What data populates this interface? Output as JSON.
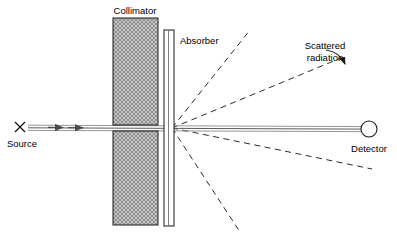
{
  "figure": {
    "title_visible": false,
    "background_color": "#ffffff",
    "width": 397,
    "height": 241,
    "type": "scientific-schematic"
  },
  "labels": {
    "collimator": "Collimator",
    "absorber": "Absorber",
    "scattered_radiation_line1": "Scattered",
    "scattered_radiation_line2": "radiation",
    "source": "Source",
    "detector": "Detector",
    "source_marker": "X"
  },
  "colors": {
    "line": "#1a1a1a",
    "beam": "#5d5d5d",
    "dashed": "#2b2b2b",
    "hatch_fill": "#9a9a9a",
    "background": "#ffffff"
  },
  "components": {
    "collimator": {
      "name": "collimator",
      "description": "two hatched blocks separated by a narrow horizontal slit",
      "upper_block": {
        "x": 113,
        "y": 18,
        "width": 45,
        "height": 107
      },
      "lower_block": {
        "x": 113,
        "y": 131,
        "width": 45,
        "height": 94
      },
      "slit_center_y": 128
    },
    "absorber": {
      "name": "absorber",
      "description": "thin vertical plate",
      "x": 164,
      "y": 30,
      "width": 10,
      "height": 196
    },
    "source": {
      "name": "source",
      "marker": "X",
      "x": 20,
      "y": 127
    },
    "detector": {
      "name": "detector",
      "shape": "circle",
      "cx": 369,
      "cy": 129,
      "r": 8
    },
    "beam": {
      "name": "primary-beam",
      "from_x": 28,
      "from_y": 127,
      "to_x": 361,
      "to_y": 129,
      "arrow_positions": [
        62,
        82
      ]
    }
  },
  "scattered_rays": [
    {
      "id": "ray-up-steep",
      "angle_deg": 56,
      "end_x": 250,
      "end_y": 30
    },
    {
      "id": "ray-up-shallow",
      "angle_deg": 20,
      "end_x": 341,
      "end_y": 58
    },
    {
      "id": "ray-down-shallow",
      "angle_deg": -12,
      "end_x": 372,
      "end_y": 169
    },
    {
      "id": "ray-down-steep",
      "angle_deg": -48,
      "end_x": 240,
      "end_y": 232
    }
  ],
  "annotation": {
    "scattered_radiation_callout": {
      "text_x": 296,
      "text_y": 48,
      "arrow_from_x": 330,
      "arrow_from_y": 53,
      "arrow_to_x": 344,
      "arrow_to_y": 66
    }
  }
}
